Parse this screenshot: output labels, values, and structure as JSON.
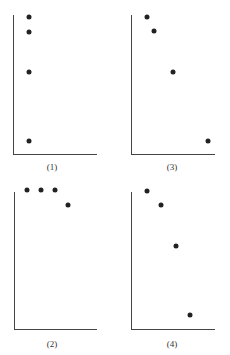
{
  "chart_data": [
    {
      "type": "scatter",
      "label": "(1)",
      "title": "",
      "xlabel": "",
      "ylabel": "",
      "grid": false,
      "points": [
        [
          1,
          4.0
        ],
        [
          1,
          3.6
        ],
        [
          1,
          2.4
        ],
        [
          1,
          0.4
        ]
      ],
      "px": {
        "axis_x": 13,
        "axis_top": 15,
        "axis_bottom": 154,
        "axis_right": 97,
        "label_x": 52,
        "label_y": 162,
        "pts": [
          [
            29,
            17
          ],
          [
            29,
            32
          ],
          [
            29,
            72
          ],
          [
            29,
            141
          ]
        ]
      }
    },
    {
      "type": "scatter",
      "label": "(3)",
      "title": "",
      "xlabel": "",
      "ylabel": "",
      "grid": false,
      "points": [
        [
          1,
          4.0
        ],
        [
          1.5,
          3.6
        ],
        [
          3,
          2.4
        ],
        [
          5.5,
          0.4
        ]
      ],
      "px": {
        "axis_x": 131,
        "axis_top": 15,
        "axis_bottom": 154,
        "axis_right": 215,
        "label_x": 172,
        "label_y": 162,
        "pts": [
          [
            147,
            17
          ],
          [
            154,
            31
          ],
          [
            173,
            72
          ],
          [
            208,
            141
          ]
        ]
      }
    },
    {
      "type": "scatter",
      "label": "(2)",
      "title": "",
      "xlabel": "",
      "ylabel": "",
      "grid": false,
      "points": [
        [
          1,
          4.0
        ],
        [
          2,
          4.0
        ],
        [
          3,
          4.0
        ],
        [
          4,
          3.6
        ]
      ],
      "px": {
        "axis_x": 14,
        "axis_top": 192,
        "axis_bottom": 329,
        "axis_right": 97,
        "label_x": 52,
        "label_y": 339,
        "pts": [
          [
            27,
            190
          ],
          [
            41,
            190
          ],
          [
            55,
            190
          ],
          [
            68,
            205
          ]
        ]
      }
    },
    {
      "type": "scatter",
      "label": "(4)",
      "title": "",
      "xlabel": "",
      "ylabel": "",
      "grid": false,
      "points": [
        [
          1,
          4.0
        ],
        [
          2,
          3.6
        ],
        [
          3,
          2.4
        ],
        [
          4,
          0.4
        ]
      ],
      "px": {
        "axis_x": 131,
        "axis_top": 192,
        "axis_bottom": 329,
        "axis_right": 215,
        "label_x": 172,
        "label_y": 339,
        "pts": [
          [
            147,
            191
          ],
          [
            161,
            205
          ],
          [
            176,
            246
          ],
          [
            190,
            315
          ]
        ]
      }
    }
  ]
}
